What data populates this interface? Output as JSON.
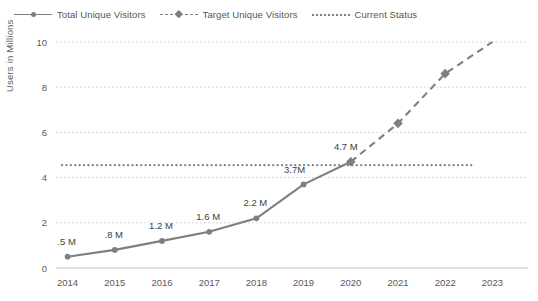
{
  "chart_data": {
    "type": "line",
    "title": "",
    "xlabel": "",
    "ylabel": "Users in Millions",
    "categories": [
      "2014",
      "2015",
      "2016",
      "2017",
      "2018",
      "2019",
      "2020",
      "2021",
      "2022",
      "2023"
    ],
    "ylim": [
      0,
      10
    ],
    "yticks": [
      0,
      2,
      4,
      6,
      8,
      10
    ],
    "grid": true,
    "legend_position": "top-left",
    "series": [
      {
        "name": "Total Unique Visitors",
        "style": "solid",
        "marker": "circle",
        "color": "#7f7f7f",
        "x": [
          "2014",
          "2015",
          "2016",
          "2017",
          "2018",
          "2019",
          "2020"
        ],
        "values": [
          0.5,
          0.8,
          1.2,
          1.6,
          2.2,
          3.7,
          4.7
        ],
        "data_labels": [
          ".5 M",
          ".8 M",
          "1.2 M",
          "1.6 M",
          "2.2 M",
          "3.7M",
          "4.7 M"
        ]
      },
      {
        "name": "Target Unique Visitors",
        "style": "dashed",
        "marker": "diamond",
        "color": "#7f7f7f",
        "x": [
          "2020",
          "2021",
          "2022",
          "2023"
        ],
        "values": [
          4.7,
          6.4,
          8.6,
          10.0
        ],
        "data_labels": [
          "",
          "",
          "",
          ""
        ]
      },
      {
        "name": "Current Status",
        "style": "dotted",
        "marker": "none",
        "color": "#808080",
        "type": "constant-line",
        "value": 4.55
      }
    ]
  },
  "legend": {
    "items": [
      {
        "label": "Total Unique Visitors",
        "style": "solid",
        "marker": "circle"
      },
      {
        "label": "Target Unique Visitors",
        "style": "dashed",
        "marker": "diamond"
      },
      {
        "label": "Current Status",
        "style": "dotted",
        "marker": "none"
      }
    ]
  },
  "axes": {
    "y_title": "Users in Millions",
    "y_ticks": [
      "0",
      "2",
      "4",
      "6",
      "8",
      "10"
    ],
    "x_ticks": [
      "2014",
      "2015",
      "2016",
      "2017",
      "2018",
      "2019",
      "2020",
      "2021",
      "2022",
      "2023"
    ]
  },
  "colors": {
    "line": "#7f7f7f",
    "grid": "#d9d9d9",
    "axis": "#bfbfbf",
    "text": "#595959",
    "label": "#404040"
  }
}
